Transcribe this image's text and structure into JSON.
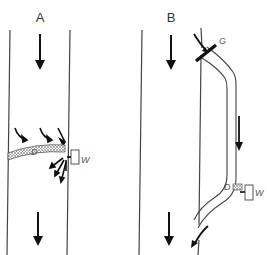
{
  "panels": [
    {
      "id": "A",
      "label": "A",
      "description": "Main vessel with internal hatched baffle D and external valve W; flow diverted out near W",
      "parts": {
        "baffle": "D",
        "valve": "W"
      }
    },
    {
      "id": "B",
      "label": "B",
      "description": "Main vessel with external bypass tube through gate G, containing plug D and valve W, rejoining vessel lower down",
      "parts": {
        "gate": "G",
        "plug": "D",
        "valve": "W"
      }
    }
  ],
  "colors": {
    "line": "#444444",
    "arrow": "#111111",
    "hatch": "#888888",
    "label": "#333333"
  }
}
